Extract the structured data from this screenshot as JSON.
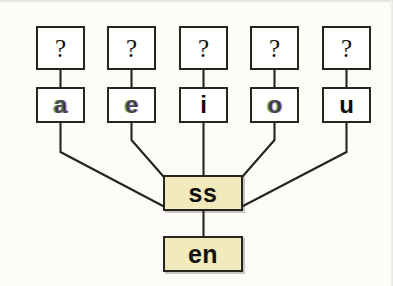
{
  "diagram": {
    "type": "tree",
    "title": "",
    "background_color": "#fdfcf8",
    "node_fill_white": "#fffffd",
    "node_fill_highlight": "#f2eabd",
    "line_color": "#26241f",
    "unknown_row": [
      {
        "id": "q1",
        "label": "?",
        "x": 36,
        "y": 26,
        "w": 49,
        "h": 44
      },
      {
        "id": "q2",
        "label": "?",
        "x": 107,
        "y": 26,
        "w": 49,
        "h": 44
      },
      {
        "id": "q3",
        "label": "?",
        "x": 179,
        "y": 26,
        "w": 49,
        "h": 44
      },
      {
        "id": "q4",
        "label": "?",
        "x": 250,
        "y": 26,
        "w": 49,
        "h": 44
      },
      {
        "id": "q5",
        "label": "?",
        "x": 322,
        "y": 26,
        "w": 49,
        "h": 44
      }
    ],
    "vowel_row": [
      {
        "id": "v-a",
        "label": "a",
        "x": 36,
        "y": 87,
        "w": 49,
        "h": 36
      },
      {
        "id": "v-e",
        "label": "e",
        "x": 107,
        "y": 87,
        "w": 49,
        "h": 36
      },
      {
        "id": "v-i",
        "label": "i",
        "x": 179,
        "y": 87,
        "w": 49,
        "h": 36
      },
      {
        "id": "v-o",
        "label": "o",
        "x": 250,
        "y": 87,
        "w": 49,
        "h": 36
      },
      {
        "id": "v-u",
        "label": "u",
        "x": 322,
        "y": 87,
        "w": 49,
        "h": 36
      }
    ],
    "morph_nodes": [
      {
        "id": "m-ss",
        "label": "ss",
        "x": 163,
        "y": 175,
        "w": 80,
        "h": 36
      },
      {
        "id": "m-en",
        "label": "en",
        "x": 163,
        "y": 236,
        "w": 80,
        "h": 36
      }
    ],
    "edges": [
      {
        "from": "q1",
        "to": "v-a",
        "kind": "vertical"
      },
      {
        "from": "q2",
        "to": "v-e",
        "kind": "vertical"
      },
      {
        "from": "q3",
        "to": "v-i",
        "kind": "vertical"
      },
      {
        "from": "q4",
        "to": "v-o",
        "kind": "vertical"
      },
      {
        "from": "q5",
        "to": "v-u",
        "kind": "vertical"
      },
      {
        "from": "v-a",
        "to": "m-ss",
        "kind": "elbow-diagonal"
      },
      {
        "from": "v-e",
        "to": "m-ss",
        "kind": "elbow-diagonal"
      },
      {
        "from": "v-i",
        "to": "m-ss",
        "kind": "vertical"
      },
      {
        "from": "v-o",
        "to": "m-ss",
        "kind": "elbow-diagonal"
      },
      {
        "from": "v-u",
        "to": "m-ss",
        "kind": "elbow-diagonal"
      },
      {
        "from": "m-ss",
        "to": "m-en",
        "kind": "vertical"
      }
    ]
  }
}
